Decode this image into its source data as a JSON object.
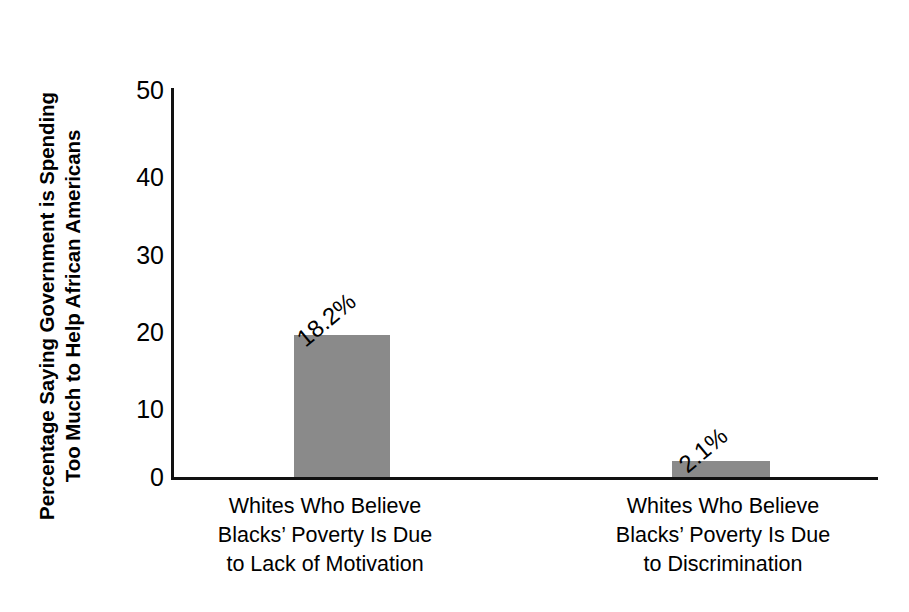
{
  "chart_data": {
    "type": "bar",
    "title": "",
    "xlabel": "",
    "ylabel": "Percentage Saying Government is Spending Too Much to Help African Americans",
    "ylabel_line1": "Percentage Saying Government is Spending",
    "ylabel_line2": "Too Much to Help African Americans",
    "categories": [
      "Whites Who Believe Blacks’ Poverty Is Due to Lack of Motivation",
      "Whites Who Believe Blacks’ Poverty Is Due to Discrimination"
    ],
    "category_lines": [
      [
        "Whites Who Believe",
        "Blacks’ Poverty Is Due",
        "to Lack of Motivation"
      ],
      [
        "Whites Who Believe",
        "Blacks’ Poverty Is Due",
        "to Discrimination"
      ]
    ],
    "values": [
      18.2,
      2.1
    ],
    "value_labels": [
      "18.2%",
      "2.1%"
    ],
    "ylim": [
      0,
      50
    ],
    "yticks": [
      50,
      40,
      30,
      20,
      10,
      0
    ],
    "ytick_labels": [
      "50",
      "40",
      "30",
      "20",
      "10",
      "0"
    ],
    "grid": false,
    "legend": null,
    "bar_color": "#8a8a8a",
    "axis_color": "#111111",
    "value_label_rotation_deg": -40
  }
}
